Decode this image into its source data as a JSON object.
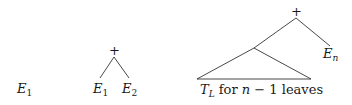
{
  "diagram": {
    "colors": {
      "stroke": "#1a1a1a",
      "background": "#ffffff"
    },
    "case1": {
      "leaf": {
        "base": "E",
        "sub": "1"
      }
    },
    "case2": {
      "root": "+",
      "left_leaf": {
        "base": "E",
        "sub": "1"
      },
      "right_leaf": {
        "base": "E",
        "sub": "2"
      }
    },
    "case3": {
      "root": "+",
      "right_leaf": {
        "base": "E",
        "sub": "n"
      },
      "subtree": {
        "base": "T",
        "sub": "L",
        "text_for": "for",
        "var_n": "n",
        "text_rest": "− 1 leaves"
      }
    }
  }
}
